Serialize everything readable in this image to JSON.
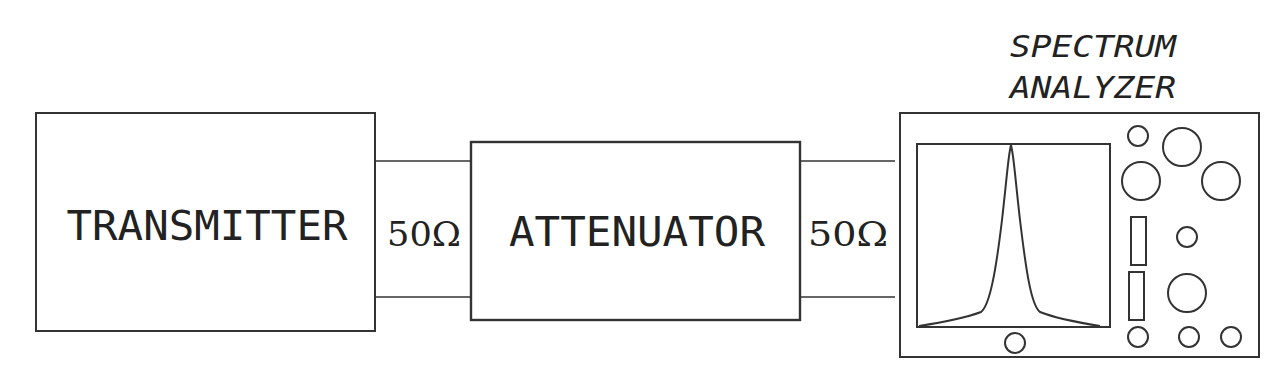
{
  "diagram": {
    "colors": {
      "stroke": "#333333",
      "text": "#222222",
      "background": "#ffffff"
    },
    "blocks": {
      "transmitter": {
        "label": "TRANSMITTER"
      },
      "attenuator": {
        "label": "ATTENUATOR"
      },
      "spectrum_analyzer": {
        "label_line1": "SPECTRUM",
        "label_line2": "ANALYZER"
      }
    },
    "connections": [
      {
        "from": "transmitter",
        "to": "attenuator",
        "impedance": "50Ω"
      },
      {
        "from": "attenuator",
        "to": "spectrum_analyzer",
        "impedance": "50Ω"
      }
    ],
    "analyzer_display": {
      "trace": "single-peak-spectrum"
    },
    "analyzer_controls": {
      "knobs": 10,
      "slots": 2
    }
  }
}
